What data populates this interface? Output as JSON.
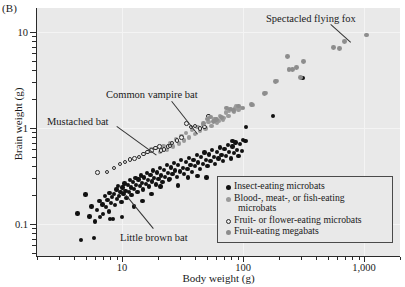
{
  "panel": {
    "label": "(B)"
  },
  "chart_data": {
    "type": "scatter",
    "title": "",
    "xlabel": "Body weight (g)",
    "ylabel": "Brain weight (g)",
    "xscale": "log",
    "yscale": "log",
    "xlim": [
      2.8,
      1450
    ],
    "ylim": [
      0.055,
      16
    ],
    "grid": true,
    "xticks": [
      10,
      100,
      1000
    ],
    "xticklabels": [
      "10",
      "100",
      "1,000"
    ],
    "yticks": [
      0.1,
      1,
      10
    ],
    "yticklabels": [
      "0.1",
      "1",
      "10"
    ],
    "legend_position": "lower right",
    "series": [
      {
        "name": "Insect-eating microbats",
        "marker": "filled-circle",
        "color": "#111111",
        "points": [
          [
            4.6,
            0.068
          ],
          [
            4.3,
            0.129
          ],
          [
            5.0,
            0.203
          ],
          [
            5.4,
            0.12
          ],
          [
            5.6,
            0.152
          ],
          [
            6.0,
            0.106
          ],
          [
            6.2,
            0.14
          ],
          [
            6.5,
            0.175
          ],
          [
            6.6,
            0.118
          ],
          [
            6.9,
            0.16
          ],
          [
            7.0,
            0.128
          ],
          [
            7.2,
            0.196
          ],
          [
            7.4,
            0.15
          ],
          [
            7.6,
            0.178
          ],
          [
            7.8,
            0.135
          ],
          [
            7.9,
            0.21
          ],
          [
            8.1,
            0.165
          ],
          [
            8.3,
            0.19
          ],
          [
            8.4,
            0.113
          ],
          [
            8.6,
            0.205
          ],
          [
            8.8,
            0.158
          ],
          [
            9.0,
            0.228
          ],
          [
            9.1,
            0.183
          ],
          [
            9.3,
            0.247
          ],
          [
            9.5,
            0.196
          ],
          [
            9.7,
            0.215
          ],
          [
            9.9,
            0.17
          ],
          [
            10.1,
            0.24
          ],
          [
            10.3,
            0.205
          ],
          [
            10.5,
            0.265
          ],
          [
            10.7,
            0.222
          ],
          [
            10.9,
            0.188
          ],
          [
            11.2,
            0.255
          ],
          [
            11.4,
            0.215
          ],
          [
            11.6,
            0.285
          ],
          [
            11.8,
            0.24
          ],
          [
            12.0,
            0.2
          ],
          [
            12.3,
            0.272
          ],
          [
            12.6,
            0.232
          ],
          [
            12.9,
            0.3
          ],
          [
            13.1,
            0.255
          ],
          [
            13.4,
            0.215
          ],
          [
            13.7,
            0.29
          ],
          [
            14.0,
            0.25
          ],
          [
            14.3,
            0.32
          ],
          [
            14.6,
            0.268
          ],
          [
            15.0,
            0.228
          ],
          [
            15.3,
            0.305
          ],
          [
            15.7,
            0.262
          ],
          [
            16.0,
            0.34
          ],
          [
            16.4,
            0.285
          ],
          [
            16.8,
            0.245
          ],
          [
            17.2,
            0.325
          ],
          [
            17.6,
            0.278
          ],
          [
            18.0,
            0.36
          ],
          [
            18.5,
            0.3
          ],
          [
            19.0,
            0.258
          ],
          [
            19.5,
            0.345
          ],
          [
            20.0,
            0.295
          ],
          [
            20.5,
            0.385
          ],
          [
            21.0,
            0.32
          ],
          [
            21.6,
            0.272
          ],
          [
            22.2,
            0.365
          ],
          [
            22.8,
            0.31
          ],
          [
            23.4,
            0.41
          ],
          [
            24.0,
            0.342
          ],
          [
            24.7,
            0.292
          ],
          [
            25.4,
            0.388
          ],
          [
            26.1,
            0.33
          ],
          [
            26.8,
            0.435
          ],
          [
            27.6,
            0.362
          ],
          [
            28.4,
            0.31
          ],
          [
            29.2,
            0.412
          ],
          [
            30.0,
            0.352
          ],
          [
            30.9,
            0.462
          ],
          [
            31.8,
            0.385
          ],
          [
            32.7,
            0.33
          ],
          [
            33.7,
            0.44
          ],
          [
            34.7,
            0.375
          ],
          [
            35.7,
            0.49
          ],
          [
            36.8,
            0.41
          ],
          [
            37.9,
            0.35
          ],
          [
            39.0,
            0.468
          ],
          [
            40.2,
            0.4
          ],
          [
            41.4,
            0.52
          ],
          [
            42.6,
            0.438
          ],
          [
            43.9,
            0.375
          ],
          [
            45.2,
            0.498
          ],
          [
            46.6,
            0.425
          ],
          [
            48.0,
            0.555
          ],
          [
            49.4,
            0.465
          ],
          [
            50.9,
            0.4
          ],
          [
            52.4,
            0.53
          ],
          [
            54.0,
            0.452
          ],
          [
            55.6,
            0.59
          ],
          [
            57.3,
            0.495
          ],
          [
            59.0,
            0.425
          ],
          [
            60.8,
            0.565
          ],
          [
            62.6,
            0.48
          ],
          [
            64.5,
            0.625
          ],
          [
            66.4,
            0.525
          ],
          [
            68.4,
            0.452
          ],
          [
            70.5,
            0.6
          ],
          [
            72.6,
            0.51
          ],
          [
            74.8,
            0.665
          ],
          [
            77.0,
            0.56
          ],
          [
            79.3,
            0.48
          ],
          [
            81.7,
            0.64
          ],
          [
            84.2,
            0.545
          ],
          [
            86.7,
            0.705
          ],
          [
            89.3,
            0.592
          ],
          [
            92.0,
            0.508
          ],
          [
            94.8,
            0.678
          ],
          [
            97.6,
            0.578
          ],
          [
            100.5,
            0.748
          ],
          [
            8.0,
            0.112
          ],
          [
            5.9,
            0.072
          ],
          [
            10.0,
            0.118
          ],
          [
            12.5,
            0.152
          ],
          [
            14.8,
            0.175
          ],
          [
            17.5,
            0.205
          ],
          [
            20.8,
            0.245
          ],
          [
            24.5,
            0.288
          ],
          [
            29.0,
            0.252
          ],
          [
            35.0,
            0.305
          ],
          [
            42.0,
            0.318
          ],
          [
            50.0,
            0.305
          ],
          [
            82.0,
            0.735
          ],
          [
            105.0,
            0.735
          ],
          [
            106.0,
            1.02
          ],
          [
            178.0,
            1.33
          ],
          [
            310.0,
            3.3
          ]
        ]
      },
      {
        "name": "Blood-, meat-, or fish-eating microbats",
        "marker": "filled-circle",
        "color": "#9a9a9a",
        "points": [
          [
            17.5,
            0.6
          ],
          [
            19.0,
            0.62
          ],
          [
            20.5,
            0.56
          ],
          [
            22.0,
            0.65
          ],
          [
            23.5,
            0.59
          ],
          [
            25.0,
            0.7
          ],
          [
            26.5,
            0.64
          ],
          [
            28.0,
            0.76
          ],
          [
            29.5,
            0.69
          ],
          [
            31.0,
            0.82
          ],
          [
            32.5,
            0.74
          ],
          [
            34.0,
            0.88
          ],
          [
            36.0,
            0.795
          ],
          [
            38.0,
            0.95
          ],
          [
            40.0,
            0.86
          ],
          [
            42.0,
            1.02
          ],
          [
            44.0,
            0.93
          ],
          [
            46.5,
            1.08
          ],
          [
            49.0,
            0.985
          ],
          [
            52.0,
            1.16
          ],
          [
            55.0,
            1.05
          ],
          [
            58.0,
            1.25
          ],
          [
            61.0,
            1.14
          ],
          [
            64.5,
            1.33
          ],
          [
            68.0,
            1.22
          ],
          [
            72.0,
            1.45
          ],
          [
            76.0,
            1.34
          ],
          [
            80.0,
            1.58
          ],
          [
            84.0,
            1.46
          ],
          [
            88.0,
            1.7
          ],
          [
            92.0,
            1.56
          ],
          [
            96.0,
            1.62
          ],
          [
            120.0,
            1.75
          ],
          [
            155.0,
            2.3
          ],
          [
            190.0,
            3.1
          ],
          [
            63.0,
            1.18
          ],
          [
            70.0,
            1.28
          ],
          [
            77.0,
            1.52
          ],
          [
            86.0,
            1.62
          ]
        ]
      },
      {
        "name": "Fruit- or flower-eating microbats",
        "marker": "open-circle",
        "color": "#2b2b2b",
        "points": [
          [
            6.3,
            0.345
          ],
          [
            7.5,
            0.35
          ],
          [
            8.6,
            0.385
          ],
          [
            9.6,
            0.42
          ],
          [
            10.6,
            0.44
          ],
          [
            11.6,
            0.47
          ],
          [
            12.7,
            0.48
          ],
          [
            13.8,
            0.5
          ],
          [
            15.0,
            0.535
          ],
          [
            16.3,
            0.56
          ],
          [
            17.6,
            0.585
          ],
          [
            19.0,
            0.62
          ],
          [
            20.5,
            0.64
          ],
          [
            22.2,
            0.6
          ],
          [
            24.0,
            0.645
          ],
          [
            26.0,
            0.7
          ],
          [
            28.5,
            0.74
          ],
          [
            31.0,
            0.8
          ],
          [
            34.0,
            1.12
          ],
          [
            37.0,
            1.02
          ],
          [
            40.0,
            1.05
          ],
          [
            44.0,
            0.985
          ],
          [
            48.0,
            1.02
          ],
          [
            52.0,
            1.34
          ],
          [
            21.0,
            0.585
          ],
          [
            25.0,
            0.65
          ]
        ]
      },
      {
        "name": "Fruit-eating megabats",
        "marker": "filled-circle",
        "color": "#8d8d8d",
        "points": [
          [
            118.0,
            1.76
          ],
          [
            150.0,
            2.28
          ],
          [
            185.0,
            3.05
          ],
          [
            240.0,
            4.1
          ],
          [
            258.0,
            4.05
          ],
          [
            278.0,
            4.3
          ],
          [
            300.0,
            3.35
          ],
          [
            318.0,
            4.95
          ],
          [
            232.0,
            5.55
          ],
          [
            560.0,
            6.85
          ],
          [
            625.0,
            6.75
          ],
          [
            690.0,
            7.95
          ],
          [
            1050.0,
            9.3
          ],
          [
            92.0,
            1.7
          ],
          [
            100.0,
            1.62
          ],
          [
            78.0,
            1.58
          ],
          [
            84.0,
            1.52
          ],
          [
            73.0,
            1.62
          ],
          [
            66.0,
            1.28
          ],
          [
            60.0,
            1.22
          ],
          [
            57.0,
            1.16
          ],
          [
            54.0,
            1.3
          ],
          [
            51.0,
            1.24
          ],
          [
            47.0,
            1.12
          ]
        ]
      }
    ],
    "annotations": [
      {
        "text": "Spectacled flying fox",
        "label_x": 266,
        "label_y": 13,
        "leader_from_x": 331,
        "leader_from_y": 24,
        "leader_to_x": 351,
        "leader_to_y": 42
      },
      {
        "text": "Common vampire bat",
        "label_x": 106,
        "label_y": 89,
        "leader_from_x": 172,
        "leader_from_y": 101,
        "leader_to_x": 198,
        "leader_to_y": 134
      },
      {
        "text": "Mustached bat",
        "label_x": 47,
        "label_y": 116,
        "leader_from_x": 117,
        "leader_from_y": 126,
        "leader_to_x": 157,
        "leader_to_y": 155
      },
      {
        "text": "Little brown bat",
        "label_x": 120,
        "label_y": 232,
        "leader_from_x": 153,
        "leader_from_y": 229,
        "leader_to_x": 126,
        "leader_to_y": 196
      }
    ]
  },
  "legend": {
    "items": [
      {
        "label": "Insect-eating microbats",
        "continuation": "",
        "marker": "insect"
      },
      {
        "label": "Blood-, meat-, or fish-eating",
        "continuation": "microbats",
        "marker": "blood"
      },
      {
        "label": "Fruit- or flower-eating microbats",
        "continuation": "",
        "marker": "fruitflower"
      },
      {
        "label": "Fruit-eating megabats",
        "continuation": "",
        "marker": "mega"
      }
    ]
  }
}
